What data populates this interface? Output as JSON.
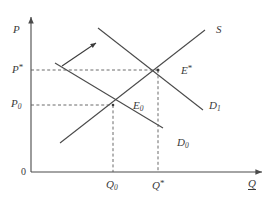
{
  "figure": {
    "background_color": "#ffffff",
    "line_color": "#4a4a4a",
    "text_color": "#3a3a3a"
  },
  "axes": {
    "y_axis_label": "P",
    "x_axis_label": "Q",
    "origin_label": "0",
    "y_axis_name": "price-axis",
    "x_axis_name": "quantity-axis"
  },
  "curves": [
    {
      "id": "supply",
      "label": "S",
      "label_sub": "",
      "kind": "supply",
      "slope": "upward",
      "start": [
        60,
        143
      ],
      "end": [
        205,
        30
      ]
    },
    {
      "id": "demand0",
      "label": "D",
      "label_sub": "0",
      "kind": "demand",
      "slope": "downward",
      "start": [
        55,
        63
      ],
      "end": [
        163,
        128
      ]
    },
    {
      "id": "demand1",
      "label": "D",
      "label_sub": "1",
      "kind": "demand",
      "slope": "downward",
      "start": [
        98,
        28
      ],
      "end": [
        203,
        110
      ]
    }
  ],
  "equilibria": [
    {
      "id": "E0",
      "label": "E",
      "label_sub": "0",
      "label_star": "",
      "x": 113,
      "y": 105,
      "price_label": "P",
      "price_sub": "0",
      "price_star": "",
      "quantity_label": "Q",
      "quantity_sub": "0",
      "quantity_star": ""
    },
    {
      "id": "Estar",
      "label": "E",
      "label_sub": "",
      "label_star": "*",
      "x": 158,
      "y": 70,
      "price_label": "P",
      "price_sub": "",
      "price_star": "*",
      "quantity_label": "Q",
      "quantity_sub": "",
      "quantity_star": "*"
    }
  ],
  "price_ticks": [
    {
      "id": "p-star",
      "base": "P",
      "star": "*",
      "sub": "",
      "y": 70
    },
    {
      "id": "p-zero",
      "base": "P",
      "star": "",
      "sub": "0",
      "y": 105
    }
  ],
  "quantity_ticks": [
    {
      "id": "q-zero",
      "base": "Q",
      "star": "",
      "sub": "0",
      "x": 113
    },
    {
      "id": "q-star",
      "base": "Q",
      "star": "*",
      "sub": "",
      "x": 158
    }
  ],
  "shift_arrow": {
    "name": "demand-shift-arrow",
    "description": "arrow indicating demand curve shifting up and to the right",
    "start": [
      62,
      66
    ],
    "end": [
      98,
      42
    ]
  },
  "labels": {
    "supply_curve": "S",
    "demand0_curve_base": "D",
    "demand0_curve_sub": "0",
    "demand1_curve_base": "D",
    "demand1_curve_sub": "1",
    "equilibrium0_base": "E",
    "equilibrium0_sub": "0",
    "equilibrium_star_base": "E",
    "equilibrium_star_mark": "*",
    "price_star_base": "P",
    "price_star_mark": "*",
    "price_zero_base": "P",
    "price_zero_sub": "0",
    "quantity_zero_base": "Q",
    "quantity_zero_sub": "0",
    "quantity_star_base": "Q",
    "quantity_star_mark": "*",
    "axis_price": "P",
    "axis_quantity": "Q",
    "origin": "0"
  }
}
